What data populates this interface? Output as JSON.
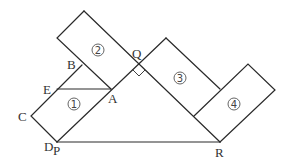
{
  "diagram": {
    "points": {
      "A": {
        "label": "A",
        "x": 111,
        "y": 89
      },
      "B": {
        "label": "B",
        "x": 82,
        "y": 65
      },
      "C": {
        "label": "C",
        "x": 31,
        "y": 116
      },
      "D": {
        "label": "D",
        "x": 57,
        "y": 142
      },
      "E": {
        "label": "E",
        "x": 57,
        "y": 90
      },
      "P": {
        "label": "P",
        "x": 57,
        "y": 142
      },
      "Q": {
        "label": "Q",
        "x": 139,
        "y": 64
      },
      "R": {
        "label": "R",
        "x": 220,
        "y": 142
      }
    },
    "regions": [
      {
        "id": "region-1",
        "label": "1"
      },
      {
        "id": "region-2",
        "label": "2"
      },
      {
        "id": "region-3",
        "label": "3"
      },
      {
        "id": "region-4",
        "label": "4"
      }
    ],
    "right_angle_at": "Q",
    "line_color": "#2a2a2a"
  }
}
